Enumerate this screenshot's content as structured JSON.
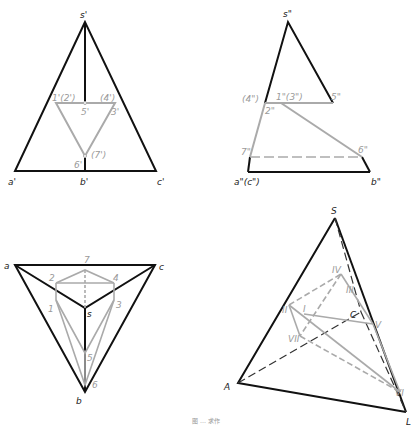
{
  "caption": "图 … 求作",
  "views": {
    "front": {
      "labels": {
        "s": "s'",
        "a": "a'",
        "b": "b'",
        "c": "c'",
        "p12": "1'(2')",
        "p4": "(4')",
        "p3": "3'",
        "p5": "5'",
        "p6": "6'",
        "p7": "(7')"
      }
    },
    "side": {
      "labels": {
        "s": "s\"",
        "ac": "a\"(c\")",
        "b": "b\"",
        "p4": "(4\")",
        "p13": "1\"(3\")",
        "p5": "5\"",
        "p2": "2\"",
        "p7": "7\"",
        "p6": "6\""
      }
    },
    "top": {
      "labels": {
        "a": "a",
        "c": "c",
        "b": "b",
        "s": "s",
        "p7": "7",
        "p2": "2",
        "p4": "4",
        "p1": "1",
        "p3": "3",
        "p5": "5",
        "p6": "6"
      }
    },
    "iso": {
      "labels": {
        "S": "S",
        "A": "A",
        "B": "L",
        "C": "C",
        "I": "I",
        "II": "II",
        "III": "III",
        "IV": "IV",
        "V": "V",
        "VI": "VI",
        "VII": "VII"
      }
    }
  },
  "colors": {
    "outline": "#111111",
    "construction": "#a0a0a0"
  }
}
